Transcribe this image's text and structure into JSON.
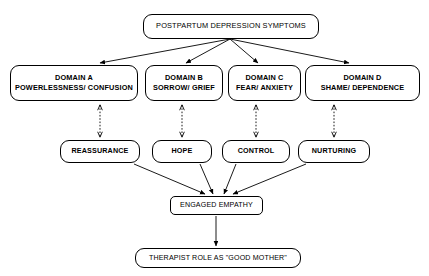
{
  "diagram": {
    "title_box": {
      "label": "POSTPARTUM DEPRESSION SYMPTOMS"
    },
    "domains": [
      {
        "id": "domain-a",
        "line1": "DOMAIN A",
        "line2": "POWERLESSNESS/ CONFUSION"
      },
      {
        "id": "domain-b",
        "line1": "DOMAIN B",
        "line2": "SORROW/ GRIEF"
      },
      {
        "id": "domain-c",
        "line1": "DOMAIN C",
        "line2": "FEAR/ ANXIETY"
      },
      {
        "id": "domain-d",
        "line1": "DOMAIN D",
        "line2": "SHAME/ DEPENDENCE"
      }
    ],
    "interventions": [
      {
        "id": "reassurance",
        "label": "REASSURANCE"
      },
      {
        "id": "hope",
        "label": "HOPE"
      },
      {
        "id": "control",
        "label": "CONTROL"
      },
      {
        "id": "nurturing",
        "label": "NURTURING"
      }
    ],
    "empathy_box": {
      "label": "ENGAGED EMPATHY"
    },
    "outcome_box": {
      "label": "THERAPIST ROLE AS \"GOOD MOTHER\""
    },
    "colors": {
      "stroke": "#000000",
      "fill": "#ffffff",
      "text": "#000000"
    }
  }
}
